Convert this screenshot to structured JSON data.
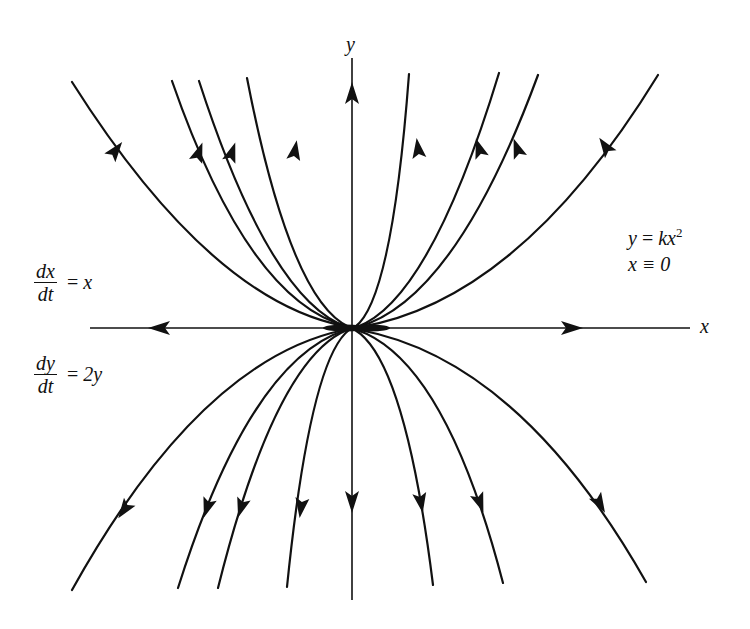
{
  "figure": {
    "type": "phase-portrait",
    "axes": {
      "x_label": "x",
      "y_label": "y"
    },
    "system": {
      "eq1": {
        "numerator": "dx",
        "denominator": "dt",
        "rhs": "x"
      },
      "eq2": {
        "numerator": "dy",
        "denominator": "dt",
        "rhs": "2y"
      }
    },
    "solutions": {
      "line1_lhs": "y",
      "line1_eq": "=",
      "line1_rhs": "kx",
      "line1_exp": "2",
      "line2": "x ≡ 0"
    },
    "colors": {
      "ink": "#111111",
      "background": "#ffffff"
    },
    "trajectory_direction": "outward from origin (unstable node)",
    "trajectory_count_upper": 9,
    "trajectory_count_lower": 8
  }
}
